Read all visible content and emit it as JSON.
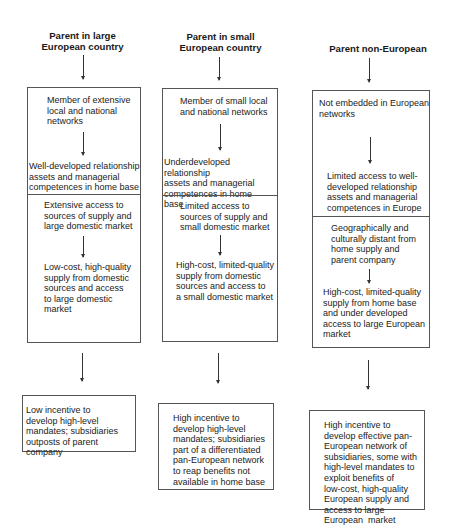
{
  "columns": [
    {
      "header": [
        "Parent in large",
        "European country"
      ],
      "box_top": {
        "step1": [
          "Member of extensive",
          "local and national",
          "networks"
        ],
        "step2": [
          "Well-developed relationship",
          "assets and managerial",
          "competences in home base"
        ]
      },
      "box_middle": {
        "step1": [
          "Extensive access to",
          "sources of supply and",
          "large domestic market"
        ],
        "step2": [
          "Low-cost, high-quality",
          "supply from domestic",
          "sources and access",
          "to large domestic",
          "market"
        ]
      },
      "outcome": [
        "Low incentive to",
        "develop high-level",
        "mandates; subsidiaries",
        "outposts of parent company"
      ]
    },
    {
      "header": [
        "Parent in small",
        "European country"
      ],
      "box_top": {
        "step1": [
          "Member of small local",
          "and national networks"
        ],
        "step2": [
          "Underdeveloped relationship",
          "assets and managerial",
          "competences in home",
          "base"
        ]
      },
      "box_middle": {
        "step1": [
          "Limited access to",
          "sources of supply and",
          "small domestic market"
        ],
        "step2": [
          "High-cost, limited-quality",
          "supply from domestic",
          "sources and access to",
          "a small domestic market"
        ]
      },
      "outcome": [
        "High incentive to",
        "develop high-level",
        "mandates; subsidiaries",
        "part of a differentiated",
        "pan-European network",
        "to reap benefits not",
        "available in home base"
      ]
    },
    {
      "header": [
        "Parent non-European"
      ],
      "box_top": {
        "step1": [
          "Not embedded in European",
          "networks"
        ],
        "step2": [
          "Limited access to well-",
          "developed relationship",
          "assets and managerial",
          "competences in Europe"
        ]
      },
      "box_middle": {
        "step1": [
          "Geographically and",
          "culturally distant from",
          "home supply and",
          "parent company"
        ],
        "step2": [
          "High-cost, limited-quality",
          "supply from home base",
          "and under developed",
          "access to large European",
          "market"
        ]
      },
      "outcome": [
        "High incentive to",
        "develop effective pan-",
        "European network of",
        "subsidiaries, some with",
        "high-level mandates to",
        "exploit benefits of",
        "low-cost, high-quality",
        "European supply and",
        "access to large",
        "European  market"
      ]
    }
  ]
}
